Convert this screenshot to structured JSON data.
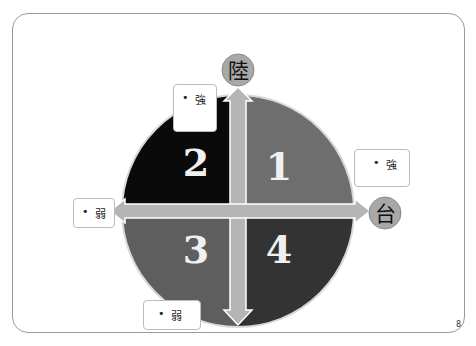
{
  "diagram": {
    "axes": {
      "vertical_label": "陸",
      "horizontal_label": "台"
    },
    "quadrants": [
      {
        "id": "1",
        "label": "1",
        "color": "#6e6e6e"
      },
      {
        "id": "2",
        "label": "2",
        "color": "#0a0a0a"
      },
      {
        "id": "3",
        "label": "3",
        "color": "#5e5e5e"
      },
      {
        "id": "4",
        "label": "4",
        "color": "#333333"
      }
    ],
    "callouts": {
      "top": {
        "bullet": "•",
        "text": "強"
      },
      "right": {
        "bullet": "•",
        "text": "強"
      },
      "left": {
        "bullet": "•",
        "text": "弱"
      },
      "bottom": {
        "bullet": "•",
        "text": "弱"
      }
    },
    "colors": {
      "arrow": "#b5b5b5",
      "arrow_edge": "#ffffff",
      "axis_circle": "#a8a8a8"
    }
  },
  "page": {
    "number": "8"
  }
}
